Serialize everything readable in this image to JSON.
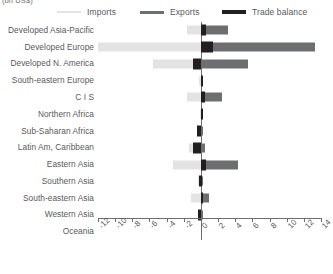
{
  "units_note": "(bn US$)",
  "legend": [
    {
      "key": "imports",
      "label": "Imports",
      "color": "#e3e3e3"
    },
    {
      "key": "exports",
      "label": "Exports",
      "color": "#6d6e70"
    },
    {
      "key": "balance",
      "label": "Trade balance",
      "color": "#231f20"
    }
  ],
  "axis": {
    "zero_label": "0",
    "tick_labels": [
      "-12",
      "-10",
      "-8",
      "-6",
      "-4",
      "-2",
      "0",
      "2",
      "4",
      "6",
      "8",
      "10",
      "12",
      "14"
    ]
  },
  "chart_data": {
    "type": "bar",
    "orientation": "horizontal",
    "title": "",
    "subtitle": "",
    "xlabel": "(bn US$)",
    "ylabel": "",
    "xlim": [
      -12,
      14
    ],
    "xticks": [
      -12,
      -10,
      -8,
      -6,
      -4,
      -2,
      0,
      2,
      4,
      6,
      8,
      10,
      12,
      14
    ],
    "grid": false,
    "legend_position": "top",
    "categories": [
      "Developed Asia-Pacific",
      "Developed Europe",
      "Developed N. America",
      "South-eastern Europe",
      "C I S",
      "Northern Africa",
      "Sub-Saharan Africa",
      "Latin Am, Caribbean",
      "Eastern Asia",
      "Southern Asia",
      "South-eastern Asia",
      "Western Asia",
      "Oceania"
    ],
    "series": [
      {
        "name": "Imports",
        "color": "#e3e3e3",
        "note": "plotted as negative values extending left of zero",
        "values": [
          -1.6,
          -12.0,
          -5.6,
          -0.2,
          -1.6,
          -0.1,
          -0.5,
          -1.4,
          -3.3,
          -0.3,
          -1.2,
          -0.2,
          0.0
        ]
      },
      {
        "name": "Exports",
        "color": "#6d6e70",
        "values": [
          3.1,
          13.3,
          5.5,
          0.2,
          2.4,
          0.1,
          0.2,
          0.5,
          4.3,
          0.2,
          1.0,
          0.3,
          0.0
        ]
      },
      {
        "name": "Trade balance",
        "color": "#231f20",
        "values": [
          0.6,
          1.4,
          -0.9,
          0.1,
          0.5,
          0.1,
          -0.4,
          -0.9,
          0.6,
          -0.2,
          0.2,
          -0.3,
          0.0
        ]
      }
    ]
  }
}
